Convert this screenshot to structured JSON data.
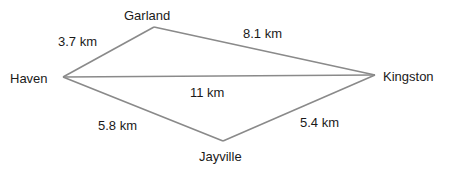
{
  "diagram": {
    "line_color": "#8a8a8a",
    "text_color": "#1a1a1a",
    "nodes": [
      {
        "id": "haven",
        "label": "Haven",
        "x": 63,
        "y": 77,
        "lx": 10,
        "ly": 72
      },
      {
        "id": "garland",
        "label": "Garland",
        "x": 154,
        "y": 27,
        "lx": 124,
        "ly": 9
      },
      {
        "id": "kingston",
        "label": "Kingston",
        "x": 375,
        "y": 75,
        "lx": 383,
        "ly": 70
      },
      {
        "id": "jayville",
        "label": "Jayville",
        "x": 223,
        "y": 141,
        "lx": 199,
        "ly": 150
      }
    ],
    "edges": [
      {
        "from": "haven",
        "to": "garland",
        "label": "3.7 km",
        "lx": 58,
        "ly": 35
      },
      {
        "from": "garland",
        "to": "kingston",
        "label": "8.1 km",
        "lx": 243,
        "ly": 27
      },
      {
        "from": "haven",
        "to": "kingston",
        "label": "11 km",
        "lx": 190,
        "ly": 86
      },
      {
        "from": "haven",
        "to": "jayville",
        "label": "5.8 km",
        "lx": 98,
        "ly": 119
      },
      {
        "from": "jayville",
        "to": "kingston",
        "label": "5.4 km",
        "lx": 300,
        "ly": 116
      }
    ]
  }
}
